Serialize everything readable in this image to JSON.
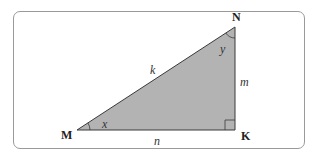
{
  "diagram": {
    "type": "right-triangle",
    "vertices": {
      "M": {
        "label": "M",
        "x": 77,
        "y": 130
      },
      "N": {
        "label": "N",
        "x": 235,
        "y": 27
      },
      "K": {
        "label": "K",
        "x": 235,
        "y": 130
      }
    },
    "sides": {
      "hypotenuse": {
        "label": "k",
        "from": "M",
        "to": "N"
      },
      "vertical": {
        "label": "m",
        "from": "N",
        "to": "K"
      },
      "horizontal": {
        "label": "n",
        "from": "M",
        "to": "K"
      }
    },
    "angles": {
      "at_M": {
        "label": "x"
      },
      "at_N": {
        "label": "y"
      },
      "at_K": {
        "label": "right-angle"
      }
    },
    "colors": {
      "fill": "#b3b3b3",
      "stroke": "#3a3a3a",
      "frame": "#9a9a9a"
    }
  }
}
